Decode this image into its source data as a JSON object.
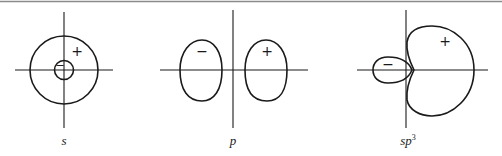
{
  "figure": {
    "panels": [
      {
        "id": "s",
        "label": "s",
        "superscript": "",
        "lobes": [
          {
            "shape": "outer-circle",
            "sign": "+"
          },
          {
            "shape": "inner-circle",
            "sign": "−"
          }
        ]
      },
      {
        "id": "p",
        "label": "p",
        "superscript": "",
        "lobes": [
          {
            "shape": "left-lobe",
            "sign": "−"
          },
          {
            "shape": "right-lobe",
            "sign": "+"
          }
        ]
      },
      {
        "id": "sp3",
        "label": "sp",
        "superscript": "3",
        "lobes": [
          {
            "shape": "small-lobe",
            "sign": "−"
          },
          {
            "shape": "large-lobe",
            "sign": "+"
          }
        ]
      }
    ]
  }
}
